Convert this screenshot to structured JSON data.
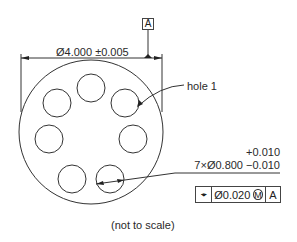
{
  "drawing": {
    "datum_label": "A",
    "overall_dimension": "Ø4.000 ±0.005",
    "callout_hole": "hole 1",
    "hole_tolerance_upper": "+0.010",
    "hole_dimension": "7×Ø0.800 −0.010",
    "fcf": {
      "symbol_icon": "position-icon",
      "symbol_glyph": "⌖",
      "tolerance": "Ø0.020",
      "modifier": "M",
      "datum": "A"
    },
    "note": "(not to scale)",
    "hole_count": 7,
    "line_color": "#333333"
  }
}
